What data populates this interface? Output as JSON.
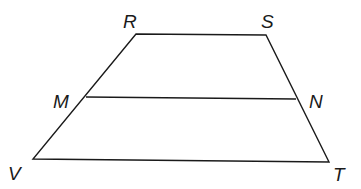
{
  "diagram": {
    "type": "trapezoid-with-midsegment",
    "line_color": "#1a1a1a",
    "vertices": {
      "R": {
        "x": 136,
        "y": 34
      },
      "S": {
        "x": 266,
        "y": 35
      },
      "M": {
        "x": 86,
        "y": 97
      },
      "N": {
        "x": 296,
        "y": 99
      },
      "V": {
        "x": 33,
        "y": 159
      },
      "T": {
        "x": 329,
        "y": 162
      }
    },
    "labels": {
      "R": "R",
      "S": "S",
      "M": "M",
      "N": "N",
      "V": "V",
      "T": "T"
    },
    "segments": [
      "RS",
      "SN",
      "NT",
      "TV",
      "VM",
      "MR",
      "MN"
    ]
  }
}
